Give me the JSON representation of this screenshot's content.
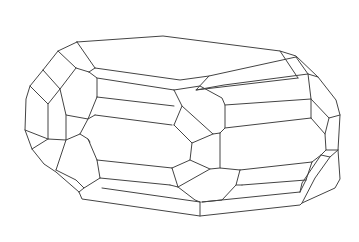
{
  "figure": {
    "stroke_color": "#444444",
    "background_color": "#ffffff",
    "stroke_width": 1
  }
}
